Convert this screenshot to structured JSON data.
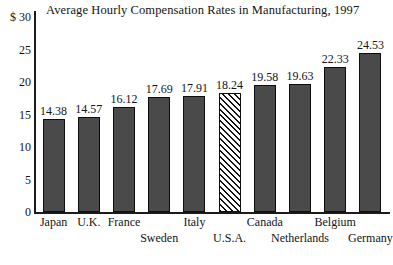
{
  "chart_data": {
    "type": "bar",
    "title": "Average Hourly Compensation Rates in Manufacturing, 1997",
    "xlabel": "",
    "ylabel": "$",
    "ylim": [
      0,
      30
    ],
    "ytick_labels": [
      "$ 30",
      "25",
      "20",
      "15",
      "10",
      "5",
      "0"
    ],
    "yticks": [
      30,
      25,
      20,
      15,
      10,
      5,
      0
    ],
    "grid": false,
    "legend": "none",
    "categories": [
      "Japan",
      "U.K.",
      "France",
      "Sweden",
      "Italy",
      "U.S.A.",
      "Canada",
      "Netherlands",
      "Belgium",
      "Germany"
    ],
    "values": [
      14.38,
      14.57,
      16.12,
      17.69,
      17.91,
      18.24,
      19.58,
      19.63,
      22.33,
      24.53
    ],
    "value_labels": [
      "14.38",
      "14.57",
      "16.12",
      "17.69",
      "17.91",
      "18.24",
      "19.58",
      "19.63",
      "22.33",
      "24.53"
    ],
    "bars": [
      {
        "category": "Japan",
        "value": 14.38,
        "label": "14.38",
        "style": "solid",
        "label_row": "top"
      },
      {
        "category": "U.K.",
        "value": 14.57,
        "label": "14.57",
        "style": "solid",
        "label_row": "top"
      },
      {
        "category": "France",
        "value": 16.12,
        "label": "16.12",
        "style": "solid",
        "label_row": "top"
      },
      {
        "category": "Sweden",
        "value": 17.69,
        "label": "17.69",
        "style": "solid",
        "label_row": "bottom"
      },
      {
        "category": "Italy",
        "value": 17.91,
        "label": "17.91",
        "style": "solid",
        "label_row": "top"
      },
      {
        "category": "U.S.A.",
        "value": 18.24,
        "label": "18.24",
        "style": "hatched",
        "label_row": "bottom"
      },
      {
        "category": "Canada",
        "value": 19.58,
        "label": "19.58",
        "style": "solid",
        "label_row": "top"
      },
      {
        "category": "Netherlands",
        "value": 19.63,
        "label": "19.63",
        "style": "solid",
        "label_row": "bottom"
      },
      {
        "category": "Belgium",
        "value": 22.33,
        "label": "22.33",
        "style": "solid",
        "label_row": "top"
      },
      {
        "category": "Germany",
        "value": 24.53,
        "label": "24.53",
        "style": "solid",
        "label_row": "bottom"
      }
    ],
    "colors": {
      "bar_fill": "#4a4a4a",
      "bar_border": "#0d0d0d",
      "highlight_bar_fill": "#ffffff",
      "highlight_bar_hatch": "#111111",
      "axis": "#1b1b1b",
      "text": "#141414",
      "background": "#ffffff"
    }
  }
}
